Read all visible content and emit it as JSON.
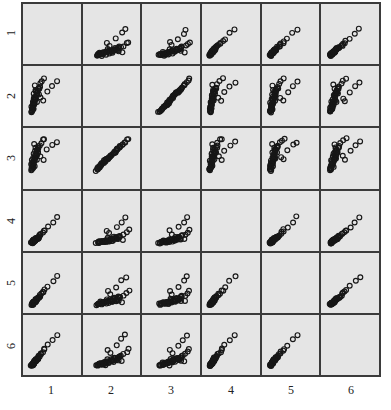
{
  "chart_data": {
    "type": "scatter",
    "title": "",
    "subtitle": "",
    "xlabel": "",
    "ylabel": "",
    "layout": "scatterplot-matrix",
    "grid": true,
    "legend": "none",
    "variables": [
      "1",
      "2",
      "3",
      "4",
      "5",
      "6"
    ],
    "n_rows": 6,
    "n_cols": 6,
    "row_labels": [
      "1",
      "2",
      "3",
      "4",
      "5",
      "6"
    ],
    "col_labels": [
      "1",
      "2",
      "3",
      "4",
      "5",
      "6"
    ],
    "diagonal": "empty",
    "axis_ranges": {
      "x": [
        0,
        1
      ],
      "y": [
        0,
        1
      ]
    },
    "marker": {
      "shape": "open-circle",
      "radius_px": 2.4,
      "stroke": "#171717",
      "fill": "none"
    },
    "panel_background": "#e5e5e5",
    "grid_line_color": "#3b3b3b",
    "n_points": 52,
    "points": {
      "v1": [
        0.1,
        0.13,
        0.09,
        0.16,
        0.12,
        0.22,
        0.08,
        0.14,
        0.19,
        0.11,
        0.17,
        0.13,
        0.25,
        0.1,
        0.15,
        0.21,
        0.12,
        0.18,
        0.09,
        0.14,
        0.23,
        0.11,
        0.16,
        0.13,
        0.2,
        0.1,
        0.27,
        0.15,
        0.12,
        0.19,
        0.14,
        0.31,
        0.11,
        0.17,
        0.13,
        0.24,
        0.09,
        0.15,
        0.2,
        0.12,
        0.35,
        0.16,
        0.1,
        0.22,
        0.14,
        0.18,
        0.13,
        0.52,
        0.6,
        0.41,
        0.28,
        0.33
      ],
      "v2": [
        0.22,
        0.45,
        0.18,
        0.63,
        0.35,
        0.55,
        0.28,
        0.72,
        0.4,
        0.31,
        0.58,
        0.25,
        0.68,
        0.38,
        0.5,
        0.6,
        0.33,
        0.47,
        0.2,
        0.53,
        0.65,
        0.29,
        0.42,
        0.36,
        0.57,
        0.24,
        0.75,
        0.44,
        0.3,
        0.61,
        0.39,
        0.8,
        0.26,
        0.49,
        0.34,
        0.66,
        0.21,
        0.43,
        0.56,
        0.32,
        0.85,
        0.48,
        0.23,
        0.64,
        0.37,
        0.52,
        0.27,
        0.7,
        0.78,
        0.59,
        0.46,
        0.41
      ],
      "v3": [
        0.3,
        0.52,
        0.25,
        0.7,
        0.44,
        0.61,
        0.36,
        0.78,
        0.48,
        0.39,
        0.65,
        0.33,
        0.74,
        0.46,
        0.57,
        0.67,
        0.41,
        0.54,
        0.28,
        0.6,
        0.71,
        0.37,
        0.5,
        0.43,
        0.63,
        0.32,
        0.8,
        0.51,
        0.38,
        0.68,
        0.47,
        0.86,
        0.34,
        0.56,
        0.42,
        0.72,
        0.29,
        0.49,
        0.62,
        0.4,
        0.88,
        0.55,
        0.31,
        0.69,
        0.45,
        0.58,
        0.35,
        0.76,
        0.82,
        0.66,
        0.53,
        0.48
      ],
      "v4": [
        0.08,
        0.11,
        0.07,
        0.14,
        0.1,
        0.18,
        0.09,
        0.13,
        0.16,
        0.09,
        0.15,
        0.11,
        0.21,
        0.08,
        0.12,
        0.17,
        0.1,
        0.14,
        0.07,
        0.12,
        0.19,
        0.09,
        0.13,
        0.11,
        0.16,
        0.08,
        0.23,
        0.12,
        0.1,
        0.15,
        0.12,
        0.28,
        0.09,
        0.14,
        0.11,
        0.2,
        0.07,
        0.12,
        0.16,
        0.1,
        0.33,
        0.13,
        0.08,
        0.18,
        0.11,
        0.15,
        0.1,
        0.48,
        0.58,
        0.38,
        0.25,
        0.3
      ],
      "v5": [
        0.09,
        0.12,
        0.08,
        0.15,
        0.11,
        0.2,
        0.09,
        0.13,
        0.18,
        0.1,
        0.16,
        0.12,
        0.24,
        0.09,
        0.14,
        0.19,
        0.11,
        0.16,
        0.08,
        0.13,
        0.22,
        0.1,
        0.15,
        0.12,
        0.18,
        0.09,
        0.26,
        0.14,
        0.11,
        0.17,
        0.13,
        0.3,
        0.1,
        0.16,
        0.12,
        0.23,
        0.08,
        0.14,
        0.19,
        0.11,
        0.36,
        0.15,
        0.09,
        0.21,
        0.13,
        0.17,
        0.12,
        0.54,
        0.63,
        0.43,
        0.29,
        0.34
      ],
      "v6": [
        0.11,
        0.15,
        0.1,
        0.19,
        0.14,
        0.25,
        0.11,
        0.17,
        0.22,
        0.13,
        0.2,
        0.15,
        0.29,
        0.11,
        0.18,
        0.24,
        0.14,
        0.21,
        0.1,
        0.17,
        0.27,
        0.13,
        0.19,
        0.15,
        0.23,
        0.12,
        0.32,
        0.18,
        0.14,
        0.22,
        0.17,
        0.37,
        0.12,
        0.2,
        0.15,
        0.28,
        0.11,
        0.18,
        0.24,
        0.14,
        0.42,
        0.19,
        0.11,
        0.26,
        0.16,
        0.21,
        0.14,
        0.61,
        0.7,
        0.5,
        0.35,
        0.4
      ]
    }
  }
}
